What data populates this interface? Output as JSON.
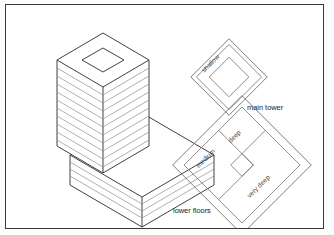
{
  "figure": {
    "background_color": "#ffffff",
    "frame_color": "#3a3a3a",
    "line_color": "#2b2b2b",
    "plan_line_color": "#6f6f6f"
  },
  "building": {
    "tower": {
      "name": "main tower",
      "floor_count": 11,
      "has_core": true,
      "core_shape": "diamond"
    },
    "podium": {
      "name": "lower floors",
      "floor_count": 4
    }
  },
  "plans": {
    "main_tower": {
      "caption": "main tower",
      "zones": [
        {
          "label": "shallow",
          "ring": "outer"
        }
      ],
      "ring_count": 3,
      "core_shape": "diamond"
    },
    "lower_floors": {
      "caption": "lower floors",
      "zones": [
        {
          "label": "medium",
          "position": "left"
        },
        {
          "label": "deep",
          "position": "top"
        },
        {
          "label": "very deep",
          "position": "lower-right"
        }
      ],
      "ring_count": 2,
      "core_shape": "diamond"
    }
  }
}
